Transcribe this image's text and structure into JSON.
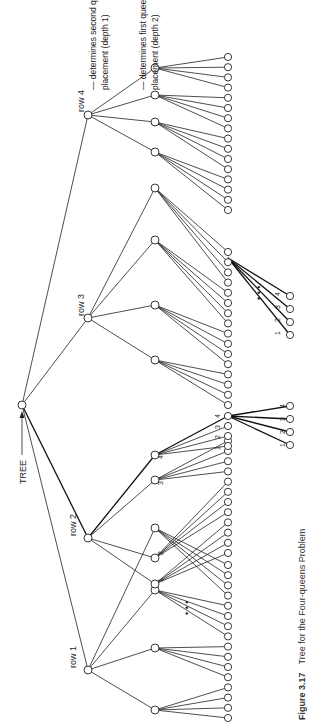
{
  "figure": {
    "root_label": "TREE",
    "row_labels": [
      "row 1",
      "row 2",
      "row 3",
      "row 4"
    ],
    "annotations": {
      "depth1_line1": "— determines second queen's",
      "depth1_line2": "placement (depth 1)",
      "depth2_line1": "— determines first queen's",
      "depth2_line2": "placement (depth 2)"
    },
    "child_labels": [
      "1",
      "2",
      "3",
      "4"
    ],
    "ellipsis": "• • •",
    "caption": {
      "number": "Figure 3.17",
      "title": "Tree for the Four-queens Problem"
    }
  },
  "colors": {
    "line": "#222222",
    "background": "#ffffff"
  }
}
